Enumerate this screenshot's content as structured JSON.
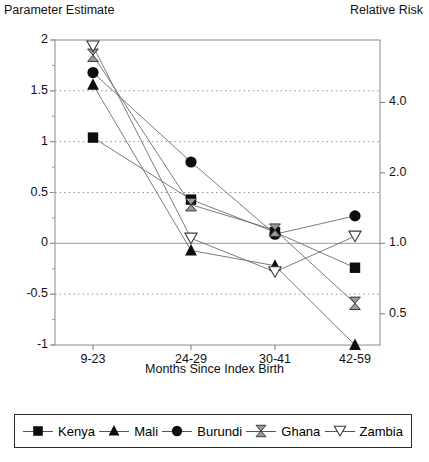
{
  "chart_data": {
    "type": "line",
    "title": "",
    "ylabel": "Parameter Estimate",
    "ylabel_right": "Relative Risk",
    "xlabel": "Months Since Index Birth",
    "categories": [
      "9-23",
      "24-29",
      "30-41",
      "42-59"
    ],
    "ylim": [
      -1,
      2
    ],
    "yticks": [
      "2",
      "1.5",
      "1",
      "0.5",
      "0",
      "-0.5",
      "-1"
    ],
    "ytick_values": [
      2,
      1.5,
      1,
      0.5,
      0,
      -0.5,
      -1
    ],
    "yticks_right": [
      "4.0",
      "2.0",
      "1.0",
      "0.5"
    ],
    "ytick_right_values": [
      1.386,
      0.693,
      0.0,
      -0.693
    ],
    "grid": true,
    "legend_position": "bottom",
    "series": [
      {
        "name": "Kenya",
        "marker": "filled-square",
        "values": [
          1.04,
          0.43,
          0.11,
          -0.24
        ]
      },
      {
        "name": "Mali",
        "marker": "filled-triangle",
        "values": [
          1.56,
          -0.07,
          -0.22,
          -1.0
        ]
      },
      {
        "name": "Burundi",
        "marker": "filled-circle",
        "values": [
          1.68,
          0.8,
          0.09,
          0.27
        ]
      },
      {
        "name": "Ghana",
        "marker": "bowtie",
        "values": [
          1.85,
          0.38,
          0.13,
          -0.59
        ]
      },
      {
        "name": "Zambia",
        "marker": "open-inverted-triangle",
        "values": [
          1.94,
          0.05,
          -0.28,
          0.07
        ]
      }
    ]
  },
  "legend": {
    "items": [
      {
        "label": "Kenya"
      },
      {
        "label": "Mali"
      },
      {
        "label": "Burundi"
      },
      {
        "label": "Ghana"
      },
      {
        "label": "Zambia"
      }
    ]
  }
}
